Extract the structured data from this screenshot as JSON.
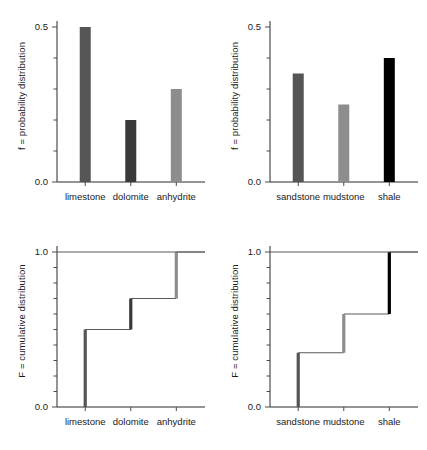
{
  "figure": {
    "title": "",
    "panels": [
      {
        "id": "carbonate-pdf",
        "position": "top-left",
        "ylabel": "f = probability distribution",
        "ytick_labels": [
          "0.0",
          "0.5"
        ]
      },
      {
        "id": "siliciclastic-pdf",
        "position": "top-right",
        "ylabel": "f = probability distribution",
        "ytick_labels": [
          "0.0",
          "0.5"
        ]
      },
      {
        "id": "carbonate-cdf",
        "position": "bottom-left",
        "ylabel": "F = cumulative distribution",
        "ytick_labels": [
          "0.0",
          "1.0"
        ]
      },
      {
        "id": "siliciclastic-cdf",
        "position": "bottom-right",
        "ylabel": "F = cumulative distribution",
        "ytick_labels": [
          "0.0",
          "1.0"
        ]
      }
    ]
  },
  "chart_data": [
    {
      "type": "bar",
      "id": "carbonate-pdf",
      "title": "",
      "xlabel": "",
      "ylabel": "f = probability distribution",
      "categories": [
        "limestone",
        "dolomite",
        "anhydrite"
      ],
      "values": [
        0.5,
        0.2,
        0.3
      ],
      "colors": [
        "#555555",
        "#3a3a3a",
        "#8d8d8d"
      ],
      "ylim": [
        0.0,
        0.5
      ],
      "yticks": [
        0.0,
        0.1,
        0.2,
        0.3,
        0.4,
        0.5
      ],
      "ytick_labels": [
        "0.0",
        "",
        "",
        "",
        "",
        "0.5"
      ],
      "grid": false,
      "legend": "none"
    },
    {
      "type": "bar",
      "id": "siliciclastic-pdf",
      "title": "",
      "xlabel": "",
      "ylabel": "f = probability distribution",
      "categories": [
        "sandstone",
        "mudstone",
        "shale"
      ],
      "values": [
        0.35,
        0.25,
        0.4
      ],
      "colors": [
        "#555555",
        "#8d8d8d",
        "#000000"
      ],
      "ylim": [
        0.0,
        0.5
      ],
      "yticks": [
        0.0,
        0.1,
        0.2,
        0.3,
        0.4,
        0.5
      ],
      "ytick_labels": [
        "0.0",
        "",
        "",
        "",
        "",
        "0.5"
      ],
      "grid": false,
      "legend": "none"
    },
    {
      "type": "line",
      "id": "carbonate-cdf",
      "title": "",
      "xlabel": "",
      "ylabel": "F = cumulative distribution",
      "categories": [
        "limestone",
        "dolomite",
        "anhydrite"
      ],
      "values": [
        0.5,
        0.7,
        1.0
      ],
      "riser_colors": [
        "#555555",
        "#3a3a3a",
        "#8d8d8d"
      ],
      "ylim": [
        0.0,
        1.0
      ],
      "yticks": [
        0.0,
        0.1,
        0.2,
        0.3,
        0.4,
        0.5,
        0.6,
        0.7,
        0.8,
        0.9,
        1.0
      ],
      "ytick_labels": [
        "0.0",
        "",
        "",
        "",
        "",
        "",
        "",
        "",
        "",
        "",
        "1.0"
      ],
      "grid": false,
      "legend": "none"
    },
    {
      "type": "line",
      "id": "siliciclastic-cdf",
      "title": "",
      "xlabel": "",
      "ylabel": "F = cumulative distribution",
      "categories": [
        "sandstone",
        "mudstone",
        "shale"
      ],
      "values": [
        0.35,
        0.6,
        1.0
      ],
      "riser_colors": [
        "#555555",
        "#8d8d8d",
        "#000000"
      ],
      "ylim": [
        0.0,
        1.0
      ],
      "yticks": [
        0.0,
        0.1,
        0.2,
        0.3,
        0.4,
        0.5,
        0.6,
        0.7,
        0.8,
        0.9,
        1.0
      ],
      "ytick_labels": [
        "0.0",
        "",
        "",
        "",
        "",
        "",
        "",
        "",
        "",
        "",
        "1.0"
      ],
      "grid": false,
      "legend": "none"
    }
  ]
}
